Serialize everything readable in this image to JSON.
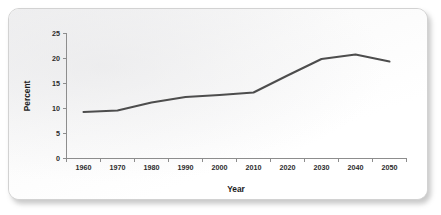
{
  "chart_data": {
    "type": "line",
    "title": "",
    "xlabel": "Year",
    "ylabel": "Percent",
    "x": [
      1960,
      1970,
      1980,
      1990,
      2000,
      2010,
      2020,
      2030,
      2040,
      2050
    ],
    "values": [
      9.3,
      9.6,
      11.2,
      12.3,
      12.7,
      13.2,
      16.6,
      19.9,
      20.8,
      19.4
    ],
    "series": [
      {
        "name": "Percent",
        "values": [
          9.3,
          9.6,
          11.2,
          12.3,
          12.7,
          13.2,
          16.6,
          19.9,
          20.8,
          19.4
        ]
      }
    ],
    "xticklabels": [
      "1960",
      "1970",
      "1980",
      "1990",
      "2000",
      "2010",
      "2020",
      "2030",
      "2040",
      "2050"
    ],
    "yticks": [
      0,
      5,
      10,
      15,
      20,
      25
    ],
    "yticklabels": [
      "0",
      "5",
      "10",
      "15",
      "20",
      "25"
    ],
    "xlim": [
      1955,
      2055
    ],
    "ylim": [
      0,
      25
    ],
    "grid": false,
    "legend": false,
    "line_color": "#4d4d4d",
    "axis_color": "#8d8d8d"
  },
  "card": {
    "background": "#fdfdfd",
    "border_color": "#d2d2d2"
  }
}
